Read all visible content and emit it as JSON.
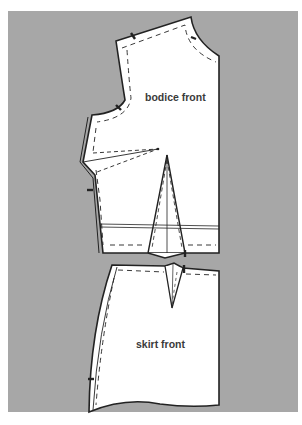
{
  "figure": {
    "background_color": "#a7a7a7",
    "piece_fill": "#ffffff",
    "line_color": "#222222"
  },
  "pieces": {
    "bodice": {
      "label": "bodice front"
    },
    "skirt": {
      "label": "skirt front"
    }
  }
}
